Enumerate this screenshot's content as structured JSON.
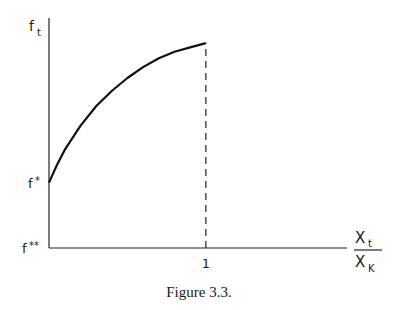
{
  "chart_data": {
    "type": "line",
    "title": "",
    "caption": "Figure 3.3.",
    "xlabel": {
      "numerator": "X",
      "numerator_sub": "t",
      "denominator": "X",
      "denominator_sub": "K"
    },
    "ylabel": {
      "main": "f",
      "sub": "t"
    },
    "x_ticks": [
      {
        "value": 1,
        "label": "1"
      }
    ],
    "y_ticks": [
      {
        "value": 0,
        "label": "f",
        "sup": "**"
      },
      {
        "value": 0.3,
        "label": "f",
        "sup": "*"
      }
    ],
    "xlim": [
      0,
      1.9
    ],
    "ylim": [
      0,
      1.0
    ],
    "grid": false,
    "series": [
      {
        "name": "f_t",
        "style": "solid",
        "x": [
          0,
          0.05,
          0.1,
          0.2,
          0.3,
          0.4,
          0.5,
          0.6,
          0.7,
          0.8,
          0.9,
          1.0
        ],
        "y": [
          0.3,
          0.38,
          0.45,
          0.56,
          0.65,
          0.72,
          0.78,
          0.83,
          0.87,
          0.9,
          0.92,
          0.94
        ]
      }
    ],
    "reference_lines": [
      {
        "name": "x-equals-1",
        "style": "dashed",
        "x": 1,
        "from_y": 0,
        "to_y": 0.94
      }
    ]
  }
}
